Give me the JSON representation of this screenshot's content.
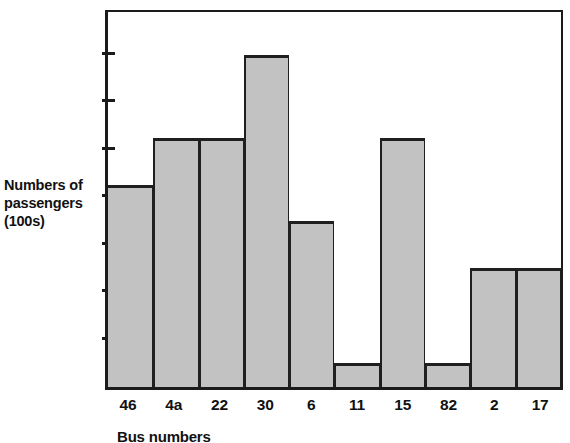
{
  "chart_data": {
    "type": "bar",
    "title": "",
    "xlabel": "Bus numbers",
    "ylabel": "Numbers of passengers (100s)",
    "ylabel_lines": [
      "Numbers of",
      "passengers",
      "(100s)"
    ],
    "categories": [
      "46",
      "4a",
      "22",
      "30",
      "6",
      "11",
      "15",
      "82",
      "2",
      "17"
    ],
    "values": [
      8.5,
      10.5,
      10.5,
      14,
      7,
      1,
      10.5,
      1,
      5,
      5
    ],
    "ylim": [
      0,
      16
    ],
    "ytick_values": [
      0,
      1,
      2,
      3,
      4,
      5,
      6,
      7,
      8,
      9,
      10,
      11,
      12,
      13,
      14,
      15,
      16
    ],
    "ytick_labels": [
      "",
      "",
      "",
      "",
      "",
      "",
      "",
      "",
      "",
      "",
      "",
      "",
      "",
      "",
      "",
      "",
      ""
    ],
    "grid": false,
    "legend": null,
    "bar_color": "#c2c2c2",
    "bar_edge_color": "#1f1f1f",
    "axis_color": "#1b1b1b",
    "background_color": "#ffffff"
  }
}
